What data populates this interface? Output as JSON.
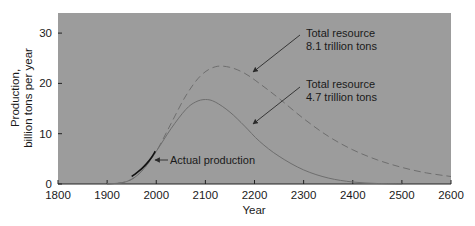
{
  "chart_data": {
    "type": "line",
    "title": "",
    "xlabel": "Year",
    "ylabel_line1": "Production,",
    "ylabel_line2": "billion tons per year",
    "ylabel": "Production, billion tons per year",
    "xlim": [
      1800,
      2600
    ],
    "ylim": [
      0,
      34
    ],
    "x_ticks": [
      1800,
      1900,
      2000,
      2100,
      2200,
      2300,
      2400,
      2500,
      2600
    ],
    "x_tick_labels": [
      "1800",
      "1900",
      "2000",
      "2100",
      "2200",
      "2300",
      "2400",
      "2500",
      "2600"
    ],
    "y_ticks": [
      0,
      10,
      20,
      30
    ],
    "y_tick_labels": [
      "0",
      "10",
      "20",
      "30"
    ],
    "grid": false,
    "background": "#9a9a9a",
    "series": [
      {
        "name": "Total resource 8.1 trillion tons",
        "style": "dashed",
        "color": "#6e6e6e",
        "x": [
          1900,
          1940,
          1970,
          2000,
          2030,
          2060,
          2090,
          2120,
          2150,
          2180,
          2210,
          2250,
          2300,
          2350,
          2400,
          2450,
          2500,
          2550,
          2600
        ],
        "values": [
          0,
          0.5,
          2.5,
          6.5,
          12,
          17.5,
          21.5,
          23.3,
          23.2,
          22,
          20,
          17,
          13,
          9.5,
          6.8,
          4.8,
          3.3,
          2.2,
          1.5
        ]
      },
      {
        "name": "Total resource 4.7 trillion tons",
        "style": "solid",
        "color": "#6e6e6e",
        "x": [
          1900,
          1940,
          1970,
          2000,
          2030,
          2060,
          2080,
          2100,
          2120,
          2150,
          2180,
          2210,
          2250,
          2300,
          2350,
          2400,
          2450,
          2500
        ],
        "values": [
          0,
          0.5,
          2.5,
          6.5,
          11,
          14.8,
          16.3,
          16.8,
          16.3,
          14.3,
          11.5,
          8.5,
          5.5,
          2.8,
          1.2,
          0.4,
          0.1,
          0
        ]
      },
      {
        "name": "Actual production",
        "style": "solid-bold",
        "color": "#111111",
        "x": [
          1950,
          1960,
          1970,
          1980,
          1990,
          1998
        ],
        "values": [
          1.5,
          2.2,
          3.0,
          4.0,
          5.2,
          6.5
        ]
      }
    ],
    "annotations": [
      {
        "text_line1": "Total resource",
        "text_line2": "8.1 trillion tons",
        "points_to": {
          "x": 2180,
          "y": 22
        }
      },
      {
        "text_line1": "Total resource",
        "text_line2": "4.7 trillion tons",
        "points_to": {
          "x": 2180,
          "y": 11.5
        }
      },
      {
        "text": "Actual production",
        "points_to": {
          "x": 1995,
          "y": 6
        }
      }
    ]
  }
}
